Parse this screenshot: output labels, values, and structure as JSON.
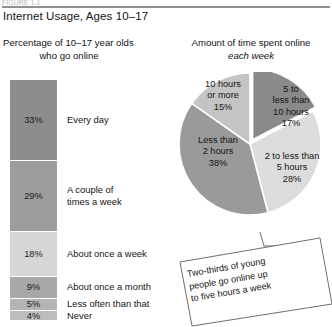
{
  "header": {
    "cropped_top_text": "FIGURE 1-1",
    "title": "Internet Usage, Ages 10–17"
  },
  "left_panel": {
    "heading_line1": "Percentage of 10–17 year olds",
    "heading_line2": "who go online"
  },
  "right_panel": {
    "heading_line1": "Amount of time spent online",
    "heading_line2": "each week"
  },
  "callout": {
    "text": "Two-thirds of young\npeople go online up\nto five hours a week"
  },
  "colors": {
    "bar_every_day": "#8d8d8d",
    "bar_couple_week": "#9d9d9d",
    "bar_once_week": "#d6d6d6",
    "bar_once_month": "#a8a8a8",
    "bar_less_often": "#b4b4b4",
    "bar_never": "#bdbdbd",
    "pie_less_than_2": "#9a9a9a",
    "pie_2_to_5": "#dcdcdc",
    "pie_5_to_10": "#8a8a8a",
    "pie_10_or_more": "#c4c4c4",
    "rule": "#8e8e8e",
    "outline": "#6f6f6f"
  },
  "chart_data": [
    {
      "type": "bar",
      "title": "Percentage of 10–17 year olds who go online",
      "orientation": "stacked-vertical",
      "xlabel": "",
      "ylabel": "",
      "categories": [
        "Every day",
        "A couple of times a week",
        "About once a week",
        "About once a month",
        "Less often than that",
        "Never"
      ],
      "values": [
        33,
        29,
        18,
        9,
        5,
        4
      ],
      "value_labels": [
        "33%",
        "29%",
        "18%",
        "9%",
        "5%",
        "4%"
      ],
      "category_labels": [
        "Every day",
        "A couple of\ntimes a week",
        "About once a week",
        "About once a month",
        "Less often than that",
        "Never"
      ],
      "unit": "percent",
      "grid": false,
      "legend": false
    },
    {
      "type": "pie",
      "title": "Amount of time spent online each week",
      "labels": [
        "Less than 2 hours",
        "2 to less than 5 hours",
        "5 to less than 10 hours",
        "10 hours or more"
      ],
      "label_text": [
        "Less than\n2 hours\n38%",
        "2 to less than\n5 hours\n28%",
        "5 to\nless than\n10 hours\n17%",
        "10 hours\nor more\n15%"
      ],
      "values": [
        38,
        28,
        17,
        15
      ],
      "value_labels": [
        "38%",
        "28%",
        "17%",
        "15%"
      ],
      "exploded": [
        "5 to less than 10 hours"
      ],
      "unit": "percent",
      "legend": false,
      "annotation": "Two-thirds of young people go online up to five hours a week"
    }
  ]
}
